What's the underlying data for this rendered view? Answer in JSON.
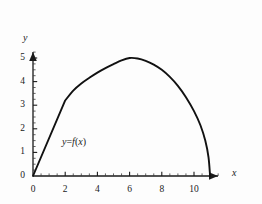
{
  "chart_data": {
    "type": "line",
    "title": "",
    "xlabel": "x",
    "ylabel": "y",
    "annotation": "y=f(x)",
    "annotation_parts": {
      "lhs": "y",
      "eq": "=",
      "fn": "f",
      "open": "(",
      "arg": "x",
      "close": ")"
    },
    "xlim": [
      0,
      11.9
    ],
    "ylim": [
      0,
      5.6
    ],
    "x_major_ticks": [
      0,
      2,
      4,
      6,
      8,
      10
    ],
    "x_major_tick_labels": [
      "0",
      "2",
      "4",
      "6",
      "8",
      "10"
    ],
    "x_minor_tick_step": 0.5,
    "y_major_ticks": [
      0,
      1,
      2,
      3,
      4,
      5
    ],
    "y_major_tick_labels": [
      "0",
      "1",
      "2",
      "3",
      "4",
      "5"
    ],
    "y_minor_tick_step": 0.25,
    "grid": false,
    "legend": false,
    "axis_arrows": true,
    "series": [
      {
        "name": "f(x)",
        "color": "#111111",
        "points": [
          {
            "x": 0.0,
            "y": 0.0
          },
          {
            "x": 0.5,
            "y": 0.8
          },
          {
            "x": 1.0,
            "y": 1.6
          },
          {
            "x": 1.5,
            "y": 2.4
          },
          {
            "x": 2.0,
            "y": 3.2
          },
          {
            "x": 2.5,
            "y": 3.62
          },
          {
            "x": 3.0,
            "y": 3.92
          },
          {
            "x": 3.5,
            "y": 4.16
          },
          {
            "x": 4.0,
            "y": 4.38
          },
          {
            "x": 4.5,
            "y": 4.57
          },
          {
            "x": 5.0,
            "y": 4.74
          },
          {
            "x": 5.5,
            "y": 4.9
          },
          {
            "x": 6.0,
            "y": 5.0
          },
          {
            "x": 6.5,
            "y": 4.98
          },
          {
            "x": 7.0,
            "y": 4.88
          },
          {
            "x": 7.5,
            "y": 4.72
          },
          {
            "x": 8.0,
            "y": 4.5
          },
          {
            "x": 8.5,
            "y": 4.2
          },
          {
            "x": 9.0,
            "y": 3.82
          },
          {
            "x": 9.5,
            "y": 3.34
          },
          {
            "x": 10.0,
            "y": 2.75
          },
          {
            "x": 10.4,
            "y": 2.15
          },
          {
            "x": 10.7,
            "y": 1.5
          },
          {
            "x": 10.9,
            "y": 0.8
          },
          {
            "x": 11.0,
            "y": 0.0
          }
        ]
      }
    ],
    "features": {
      "kink_at": {
        "x": 2.0,
        "y": 3.2
      },
      "maximum_at": {
        "x": 6.0,
        "y": 5.0
      },
      "x_intercepts": [
        0.0,
        11.0
      ]
    },
    "colors": {
      "axis": "#1a1a1a",
      "curve": "#111111",
      "background": "#fdfdfd"
    }
  }
}
